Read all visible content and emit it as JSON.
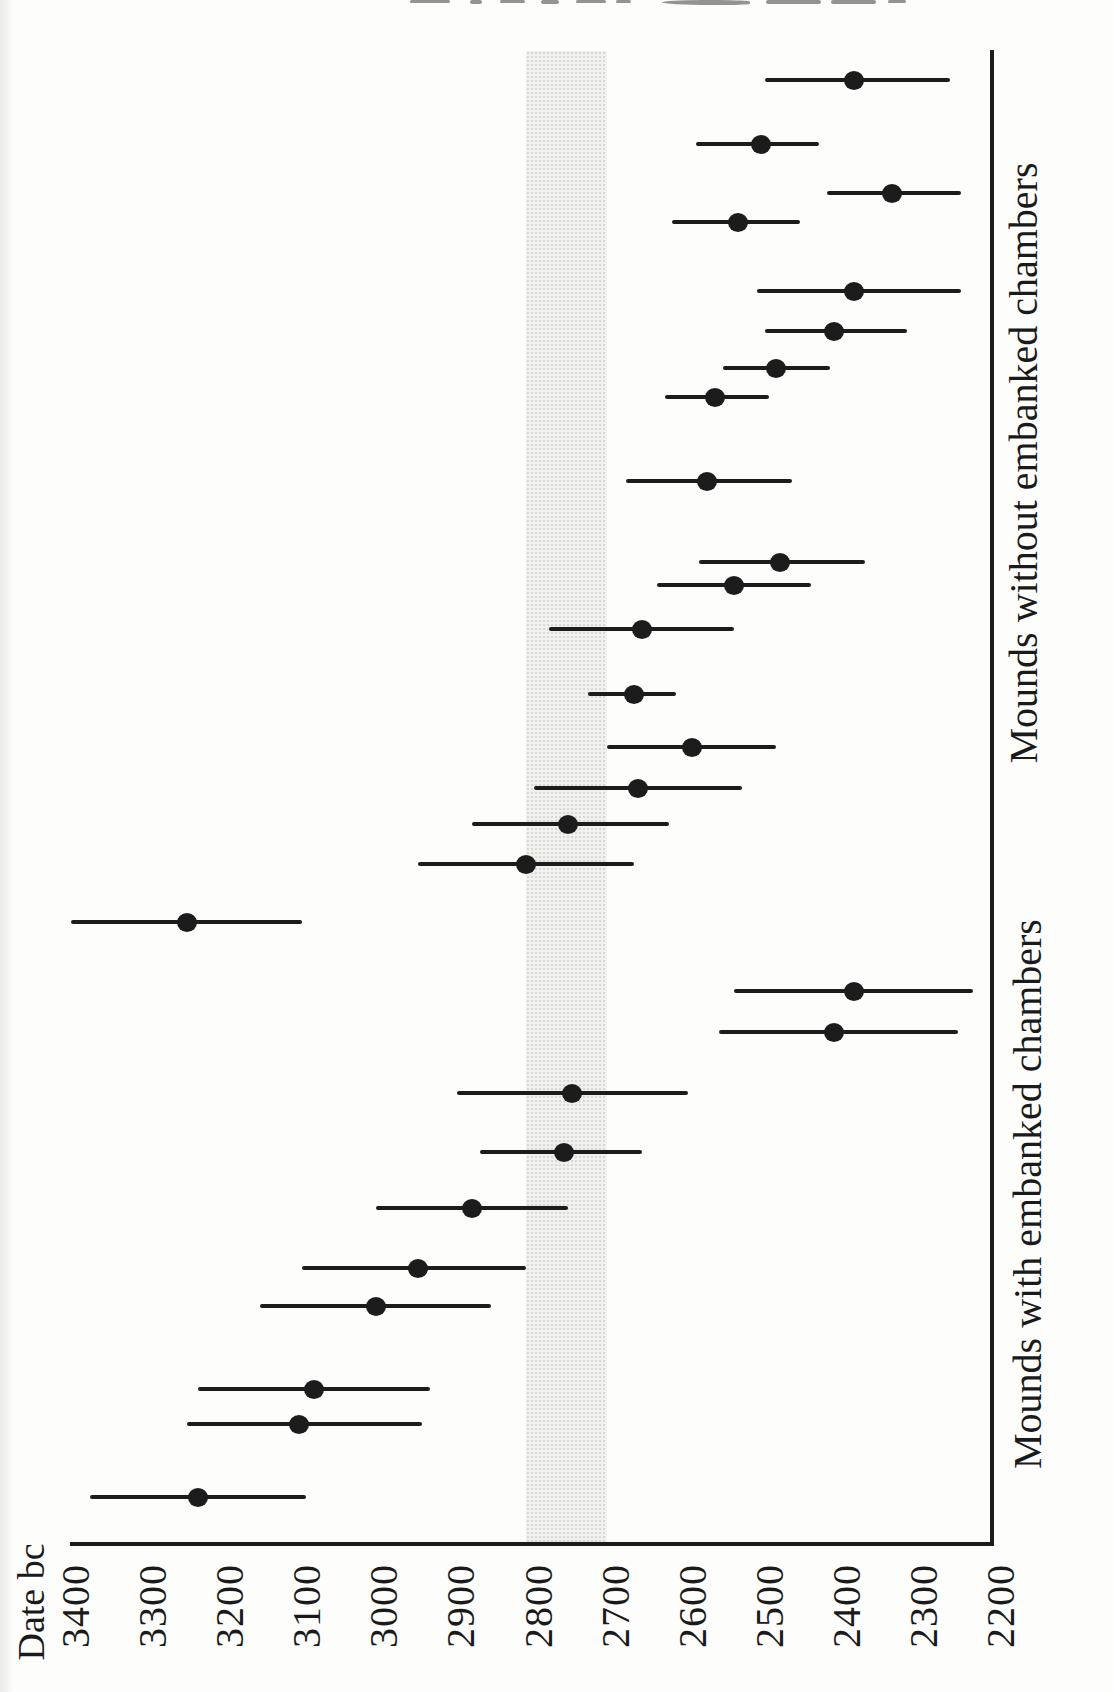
{
  "figure": {
    "type_note": "Scanned book figure rotated 90 degrees; all text reads bottom-to-top",
    "axis_title": "Date bc"
  },
  "chart_data": {
    "type": "scatter",
    "subtype": "radiocarbon-date-error-bars",
    "title": "",
    "xlabel": "Date bc",
    "axis": {
      "label": "Date bc",
      "min": 2200,
      "max": 3400,
      "ticks": [
        3400,
        3300,
        3200,
        3100,
        3000,
        2900,
        2800,
        2700,
        2600,
        2500,
        2400,
        2300,
        2200
      ],
      "orientation": "rotated: dates run along page edge, 3400 near spine corner to 2200 at axis corner",
      "grid": false
    },
    "shaded_band": {
      "date_older": 2815,
      "date_younger": 2710,
      "meaning": "highlight band near 2800-2700 bc"
    },
    "series": [
      {
        "name": "Mounds without embanked chambers",
        "points": [
          {
            "date": 2390,
            "max": 2505,
            "min": 2265,
            "y_px": 80
          },
          {
            "date": 2510,
            "max": 2595,
            "min": 2435,
            "y_px": 144
          },
          {
            "date": 2340,
            "max": 2425,
            "min": 2250,
            "y_px": 193
          },
          {
            "date": 2540,
            "max": 2625,
            "min": 2460,
            "y_px": 222
          },
          {
            "date": 2390,
            "max": 2515,
            "min": 2250,
            "y_px": 291
          },
          {
            "date": 2415,
            "max": 2505,
            "min": 2320,
            "y_px": 331
          },
          {
            "date": 2490,
            "max": 2560,
            "min": 2420,
            "y_px": 368
          },
          {
            "date": 2570,
            "max": 2635,
            "min": 2500,
            "y_px": 397
          },
          {
            "date": 2580,
            "max": 2685,
            "min": 2470,
            "y_px": 481
          },
          {
            "date": 2485,
            "max": 2590,
            "min": 2375,
            "y_px": 562
          },
          {
            "date": 2545,
            "max": 2645,
            "min": 2445,
            "y_px": 585
          },
          {
            "date": 2665,
            "max": 2785,
            "min": 2545,
            "y_px": 629
          },
          {
            "date": 2675,
            "max": 2735,
            "min": 2620,
            "y_px": 694
          },
          {
            "date": 2600,
            "max": 2710,
            "min": 2490,
            "y_px": 747
          },
          {
            "date": 2670,
            "max": 2805,
            "min": 2535,
            "y_px": 788
          },
          {
            "date": 2760,
            "max": 2885,
            "min": 2630,
            "y_px": 824
          },
          {
            "date": 2815,
            "max": 2955,
            "min": 2675,
            "y_px": 864
          }
        ]
      },
      {
        "name": "Mounds with embanked chambers",
        "points": [
          {
            "date": 3255,
            "max": 3405,
            "min": 3105,
            "y_px": 922
          },
          {
            "date": 2390,
            "max": 2545,
            "min": 2235,
            "y_px": 991
          },
          {
            "date": 2415,
            "max": 2565,
            "min": 2255,
            "y_px": 1032
          },
          {
            "date": 2755,
            "max": 2905,
            "min": 2605,
            "y_px": 1093
          },
          {
            "date": 2765,
            "max": 2875,
            "min": 2665,
            "y_px": 1152
          },
          {
            "date": 2885,
            "max": 3010,
            "min": 2760,
            "y_px": 1208
          },
          {
            "date": 2955,
            "max": 3105,
            "min": 2815,
            "y_px": 1268
          },
          {
            "date": 3010,
            "max": 3160,
            "min": 2860,
            "y_px": 1306
          },
          {
            "date": 3090,
            "max": 3240,
            "min": 2940,
            "y_px": 1389
          },
          {
            "date": 3110,
            "max": 3255,
            "min": 2950,
            "y_px": 1424
          },
          {
            "date": 3240,
            "max": 3380,
            "min": 3100,
            "y_px": 1497
          }
        ]
      }
    ],
    "legend_position": "group names printed beside spine, rotated"
  }
}
